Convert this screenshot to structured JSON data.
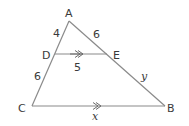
{
  "figure": {
    "colors": {
      "stroke": "#8a8a8a",
      "text": "#3a3a3a",
      "background": "#ffffff"
    },
    "vertices": {
      "A": {
        "label": "A",
        "x": 69,
        "y": 21
      },
      "B": {
        "label": "B",
        "x": 165,
        "y": 106
      },
      "C": {
        "label": "C",
        "x": 32,
        "y": 106
      },
      "D": {
        "label": "D",
        "x": 55,
        "y": 54
      },
      "E": {
        "label": "E",
        "x": 107,
        "y": 54
      }
    },
    "segments": [
      {
        "from": "A",
        "to": "C"
      },
      {
        "from": "A",
        "to": "B"
      },
      {
        "from": "C",
        "to": "B"
      },
      {
        "from": "D",
        "to": "E"
      }
    ],
    "measures": {
      "AD": "4",
      "AE": "6",
      "DE": "5",
      "DC": "6",
      "EB": "y",
      "CB": "x"
    },
    "parallel_marks": {
      "DE": "double-arrow",
      "CB": "double-arrow"
    }
  }
}
